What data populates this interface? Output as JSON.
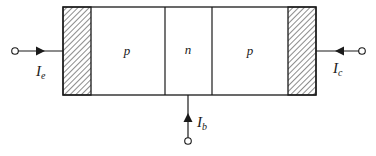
{
  "diagram": {
    "type": "pnp-transistor-structure",
    "regions": [
      {
        "id": "emitter-contact",
        "label": "",
        "style": "hatched"
      },
      {
        "id": "emitter",
        "label": "p"
      },
      {
        "id": "base",
        "label": "n"
      },
      {
        "id": "collector",
        "label": "p"
      },
      {
        "id": "collector-contact",
        "label": "",
        "style": "hatched"
      }
    ],
    "currents": {
      "emitter": {
        "symbol": "I",
        "sub": "e"
      },
      "collector": {
        "symbol": "I",
        "sub": "c"
      },
      "base": {
        "symbol": "I",
        "sub": "b"
      }
    },
    "colors": {
      "line": "#1a1a1a",
      "background": "#ffffff"
    }
  }
}
